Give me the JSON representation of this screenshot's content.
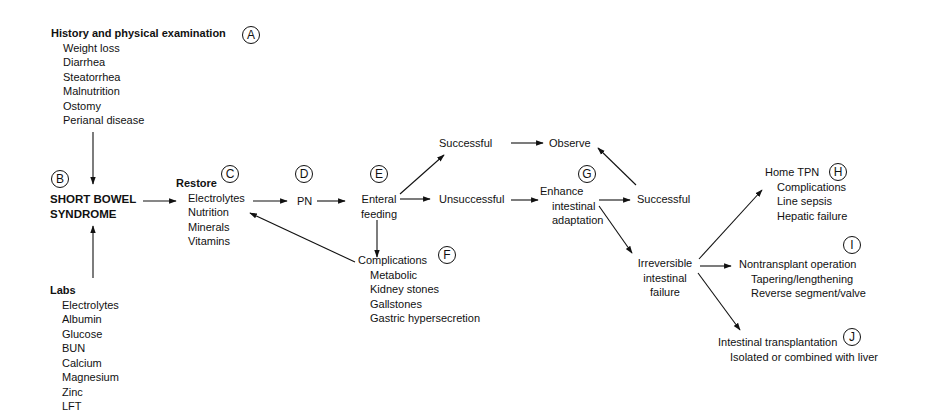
{
  "history": {
    "title": "History and physical examination",
    "label": "A",
    "items": [
      "Weight loss",
      "Diarrhea",
      "Steatorrhea",
      "Malnutrition",
      "Ostomy",
      "Perianal disease"
    ]
  },
  "sbs": {
    "label": "B",
    "line1": "SHORT BOWEL",
    "line2": "SYNDROME"
  },
  "labs": {
    "title": "Labs",
    "items": [
      "Electrolytes",
      "Albumin",
      "Glucose",
      "BUN",
      "Calcium",
      "Magnesium",
      "Zinc",
      "LFT"
    ]
  },
  "restore": {
    "title": "Restore",
    "label": "C",
    "items": [
      "Electrolytes",
      "Nutrition",
      "Minerals",
      "Vitamins"
    ]
  },
  "pn": {
    "label": "D",
    "text": "PN"
  },
  "enteral": {
    "label": "E",
    "line1": "Enteral",
    "line2": "feeding"
  },
  "successful1": "Successful",
  "unsuccessful": "Unsuccessful",
  "observe": "Observe",
  "complications": {
    "title": "Complications",
    "label": "F",
    "items": [
      "Metabolic",
      "Kidney stones",
      "Gallstones",
      "Gastric hypersecretion"
    ]
  },
  "enhance": {
    "label": "G",
    "line1": "Enhance",
    "line2": "intestinal",
    "line3": "adaptation"
  },
  "successful2": "Successful",
  "irreversible": {
    "line1": "Irreversible",
    "line2": "intestinal",
    "line3": "failure"
  },
  "home_tpn": {
    "title": "Home TPN",
    "label": "H",
    "items": [
      "Complications",
      "Line sepsis",
      "Hepatic failure"
    ]
  },
  "nontransplant": {
    "title": "Nontransplant operation",
    "label": "I",
    "items": [
      "Tapering/lengthening",
      "Reverse segment/valve"
    ]
  },
  "transplant": {
    "title": "Intestinal transplantation",
    "label": "J",
    "items": [
      "Isolated or combined with liver"
    ]
  }
}
